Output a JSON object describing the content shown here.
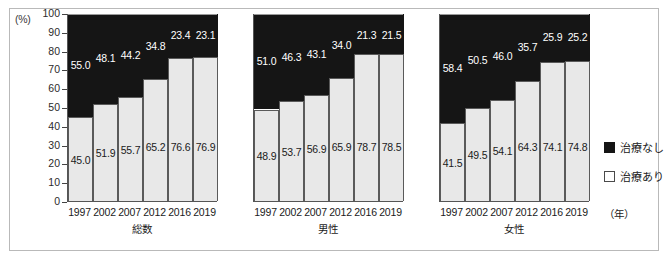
{
  "axis": {
    "unit_label": "(%)",
    "year_unit_label": "（年）",
    "yticks": [
      "100",
      "90",
      "80",
      "70",
      "60",
      "50",
      "40",
      "30",
      "20",
      "10",
      "0"
    ]
  },
  "legend": {
    "items": [
      {
        "label": "治療なし",
        "color": "#151515",
        "swatch": "dark"
      },
      {
        "label": "治療あり",
        "color": "#ffffff",
        "swatch": "light"
      }
    ]
  },
  "chart_data": {
    "type": "bar",
    "title": "",
    "subtitle": "",
    "xlabel": "（年）",
    "ylabel": "(%)",
    "ylim": [
      0,
      100
    ],
    "ytick_step": 10,
    "grid": false,
    "stacked": true,
    "stack_total": 100,
    "legend_position": "right",
    "categories": [
      "1997",
      "2002",
      "2007",
      "2012",
      "2016",
      "2019"
    ],
    "panels": [
      {
        "name": "総数",
        "series": [
          {
            "name": "治療あり",
            "values": [
              45.0,
              51.9,
              55.7,
              65.2,
              76.6,
              76.9
            ]
          },
          {
            "name": "治療なし",
            "values": [
              55.0,
              48.1,
              44.2,
              34.8,
              23.4,
              23.1
            ]
          }
        ],
        "labels_bottom": [
          "45.0",
          "51.9",
          "55.7",
          "65.2",
          "76.6",
          "76.9"
        ],
        "labels_top": [
          "55.0",
          "48.1",
          "44.2",
          "34.8",
          "23.4",
          "23.1"
        ]
      },
      {
        "name": "男性",
        "series": [
          {
            "name": "治療あり",
            "values": [
              48.9,
              53.7,
              56.9,
              65.9,
              78.7,
              78.5
            ]
          },
          {
            "name": "治療なし",
            "values": [
              51.0,
              46.3,
              43.1,
              34.0,
              21.3,
              21.5
            ]
          }
        ],
        "labels_bottom": [
          "48.9",
          "53.7",
          "56.9",
          "65.9",
          "78.7",
          "78.5"
        ],
        "labels_top": [
          "51.0",
          "46.3",
          "43.1",
          "34.0",
          "21.3",
          "21.5"
        ]
      },
      {
        "name": "女性",
        "series": [
          {
            "name": "治療あり",
            "values": [
              41.5,
              49.5,
              54.1,
              64.3,
              74.1,
              74.8
            ]
          },
          {
            "name": "治療なし",
            "values": [
              58.4,
              50.5,
              46.0,
              35.7,
              25.9,
              25.2
            ]
          }
        ],
        "labels_bottom": [
          "41.5",
          "49.5",
          "54.1",
          "64.3",
          "74.1",
          "74.8"
        ],
        "labels_top": [
          "58.4",
          "50.5",
          "46.0",
          "35.7",
          "25.9",
          "25.2"
        ]
      }
    ]
  }
}
